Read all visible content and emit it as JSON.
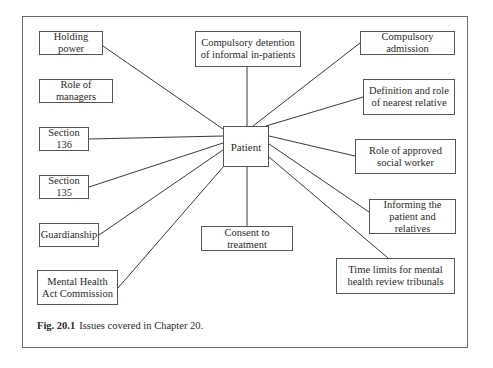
{
  "diagram": {
    "type": "hub-and-spoke",
    "center": {
      "id": "patient",
      "label": "Patient",
      "box": [
        223,
        126,
        46,
        41
      ]
    },
    "nodes": [
      {
        "id": "holding-power",
        "label": "Holding power",
        "box": [
          39,
          31,
          64,
          24
        ],
        "connected": true,
        "anchor": [
          103,
          46
        ]
      },
      {
        "id": "role-of-managers",
        "label": "Role of managers",
        "box": [
          39,
          79,
          74,
          24
        ],
        "connected": false
      },
      {
        "id": "compulsory-detention",
        "label": "Compulsory detention of informal in-patients",
        "box": [
          195,
          31,
          106,
          36
        ],
        "connected": true,
        "anchor": [
          247,
          67
        ]
      },
      {
        "id": "compulsory-admission",
        "label": "Compulsory admission",
        "box": [
          360,
          31,
          95,
          24
        ],
        "connected": true,
        "anchor": [
          360,
          43
        ]
      },
      {
        "id": "nearest-relative",
        "label": "Definition and role of nearest relative",
        "box": [
          363,
          79,
          92,
          36
        ],
        "connected": true,
        "anchor": [
          363,
          97
        ]
      },
      {
        "id": "section-136",
        "label": "Section 136",
        "box": [
          39,
          127,
          50,
          24
        ],
        "connected": true,
        "anchor": [
          89,
          139
        ]
      },
      {
        "id": "approved-social-worker",
        "label": "Role of approved social worker",
        "box": [
          355,
          139,
          101,
          35
        ],
        "connected": true,
        "anchor": [
          355,
          156
        ]
      },
      {
        "id": "section-135",
        "label": "Section 135",
        "box": [
          39,
          175,
          50,
          24
        ],
        "connected": true,
        "anchor": [
          89,
          187
        ]
      },
      {
        "id": "informing",
        "label": "Informing the patient and relatives",
        "box": [
          369,
          199,
          87,
          35
        ],
        "connected": true,
        "anchor": [
          369,
          212
        ]
      },
      {
        "id": "guardianship",
        "label": "Guardianship",
        "box": [
          39,
          223,
          60,
          24
        ],
        "connected": true,
        "anchor": [
          99,
          235
        ]
      },
      {
        "id": "consent",
        "label": "Consent to treatment",
        "box": [
          201,
          226,
          92,
          25
        ],
        "connected": true,
        "anchor": [
          247,
          226
        ]
      },
      {
        "id": "time-limits",
        "label": "Time limits for mental health review tribunals",
        "box": [
          336,
          258,
          119,
          36
        ],
        "connected": true,
        "anchor": [
          388,
          258
        ]
      },
      {
        "id": "mhac",
        "label": "Mental Health Act Commission",
        "box": [
          37,
          270,
          81,
          35
        ],
        "connected": true,
        "anchor": [
          118,
          288
        ]
      }
    ],
    "center_anchors": {
      "holding-power": [
        223,
        129
      ],
      "compulsory-detention": [
        247,
        126
      ],
      "compulsory-admission": [
        253,
        126
      ],
      "nearest-relative": [
        266,
        126
      ],
      "section-136": [
        223,
        136
      ],
      "approved-social-worker": [
        269,
        136
      ],
      "section-135": [
        223,
        143
      ],
      "informing": [
        269,
        144
      ],
      "guardianship": [
        223,
        150
      ],
      "consent": [
        247,
        167
      ],
      "time-limits": [
        269,
        157
      ],
      "mhac": [
        224,
        166
      ]
    }
  },
  "caption": {
    "label": "Fig. 20.1",
    "text": "Issues covered in Chapter 20."
  }
}
